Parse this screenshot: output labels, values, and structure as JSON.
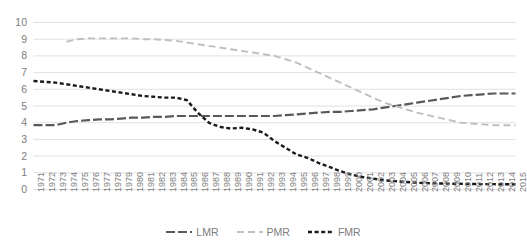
{
  "chart_data": {
    "type": "line",
    "title": "",
    "xlabel": "",
    "ylabel": "",
    "ylim": [
      0,
      10
    ],
    "ytick_values": [
      0,
      1,
      2,
      3,
      4,
      5,
      6,
      7,
      8,
      9,
      10
    ],
    "ytick_labels": [
      "0",
      "1",
      "2",
      "3",
      "4",
      "5",
      "6",
      "7",
      "8",
      "9",
      "10"
    ],
    "grid": true,
    "legend_position": "bottom-center",
    "x": [
      1971,
      1972,
      1973,
      1974,
      1975,
      1976,
      1977,
      1978,
      1979,
      1980,
      1981,
      1982,
      1983,
      1984,
      1985,
      1986,
      1987,
      1988,
      1989,
      1990,
      1991,
      1992,
      1993,
      1994,
      1995,
      1996,
      1997,
      1998,
      1999,
      2000,
      2001,
      2002,
      2003,
      2004,
      2005,
      2006,
      2007,
      2008,
      2009,
      2010,
      2011,
      2012,
      2013,
      2014,
      2015
    ],
    "xtick_labels": [
      "1971",
      "1972",
      "1973",
      "1974",
      "1975",
      "1976",
      "1977",
      "1978",
      "1979",
      "1980",
      "1981",
      "1982",
      "1983",
      "1984",
      "1985",
      "1986",
      "1987",
      "1988",
      "1989",
      "1990",
      "1991",
      "1992",
      "1993",
      "1994",
      "1995",
      "1996",
      "1997",
      "1998",
      "1999",
      "2000",
      "2001",
      "2002",
      "2003",
      "2004",
      "2005",
      "2006",
      "2007",
      "2008",
      "2009",
      "2010",
      "2011",
      "2012",
      "2013",
      "2014",
      "2015"
    ],
    "series": [
      {
        "name": "LMR",
        "color": "#595959",
        "dash": "dash-dot",
        "values": [
          3.85,
          3.85,
          3.85,
          4.0,
          4.1,
          4.15,
          4.2,
          4.2,
          4.25,
          4.3,
          4.3,
          4.35,
          4.35,
          4.4,
          4.4,
          4.4,
          4.4,
          4.4,
          4.4,
          4.4,
          4.4,
          4.4,
          4.4,
          4.45,
          4.5,
          4.55,
          4.6,
          4.65,
          4.65,
          4.7,
          4.75,
          4.8,
          4.9,
          5.0,
          5.1,
          5.2,
          5.3,
          5.4,
          5.5,
          5.6,
          5.65,
          5.7,
          5.75,
          5.75,
          5.75
        ]
      },
      {
        "name": "PMR",
        "color": "#bfbfbf",
        "dash": "dash",
        "values": [
          null,
          null,
          null,
          8.85,
          9.0,
          9.05,
          9.05,
          9.05,
          9.05,
          9.05,
          9.0,
          9.0,
          8.95,
          8.9,
          8.8,
          8.7,
          8.6,
          8.5,
          8.4,
          8.3,
          8.2,
          8.1,
          8.0,
          7.8,
          7.6,
          7.3,
          7.0,
          6.7,
          6.4,
          6.1,
          5.8,
          5.5,
          5.2,
          5.0,
          4.8,
          4.6,
          4.45,
          4.3,
          4.15,
          4.0,
          3.95,
          3.9,
          3.85,
          3.85,
          3.85
        ]
      },
      {
        "name": "FMR",
        "color": "#1a1a1a",
        "dash": "dot",
        "values": [
          6.5,
          6.45,
          6.4,
          6.3,
          6.2,
          6.1,
          6.0,
          5.9,
          5.8,
          5.7,
          5.6,
          5.55,
          5.5,
          5.5,
          5.35,
          4.6,
          4.0,
          3.75,
          3.65,
          3.7,
          3.6,
          3.4,
          2.9,
          2.5,
          2.1,
          1.9,
          1.6,
          1.35,
          1.1,
          0.9,
          0.75,
          0.65,
          0.55,
          0.5,
          0.45,
          0.4,
          0.38,
          0.36,
          0.35,
          0.34,
          0.33,
          0.32,
          0.32,
          0.31,
          0.31
        ]
      }
    ]
  },
  "legend": {
    "items": [
      {
        "label": "LMR"
      },
      {
        "label": "PMR"
      },
      {
        "label": "FMR"
      }
    ]
  }
}
